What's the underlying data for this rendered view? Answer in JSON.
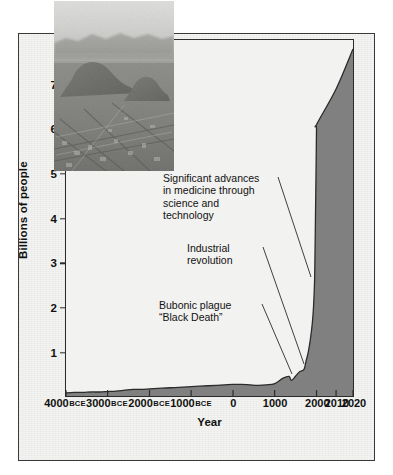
{
  "chart_data": {
    "type": "area",
    "title": "",
    "xlabel": "Year",
    "ylabel": "Billions of people",
    "xlim": [
      -4000,
      2020
    ],
    "ylim": [
      0,
      8
    ],
    "grid": false,
    "legend": null,
    "x_tick_labels": [
      {
        "label": "4000",
        "era": "BCE",
        "pos": 0
      },
      {
        "label": "3000",
        "era": "BCE",
        "pos": 14.5
      },
      {
        "label": "2000",
        "era": "BCE",
        "pos": 29.1
      },
      {
        "label": "1000",
        "era": "BCE",
        "pos": 43.6
      },
      {
        "label": "0",
        "era": "",
        "pos": 58.2
      },
      {
        "label": "1000",
        "era": "",
        "pos": 72.7
      },
      {
        "label": "2000",
        "era": "",
        "pos": 87.3
      },
      {
        "label": "2010",
        "era": "",
        "pos": 94.1
      },
      {
        "label": "2020",
        "era": "",
        "pos": 100
      }
    ],
    "y_tick_labels": [
      "1",
      "2",
      "3",
      "4",
      "5",
      "6",
      "7"
    ],
    "y_tick_values": [
      1,
      2,
      3,
      4,
      5,
      6,
      7
    ],
    "series_name": "World population",
    "x": [
      -4000,
      -3800,
      -3600,
      -3400,
      -3200,
      -3000,
      -2800,
      -2600,
      -2400,
      -2200,
      -2000,
      -1800,
      -1600,
      -1400,
      -1200,
      -1000,
      -800,
      -600,
      -400,
      -200,
      0,
      200,
      400,
      600,
      800,
      1000,
      1200,
      1340,
      1400,
      1500,
      1600,
      1700,
      1750,
      1800,
      1850,
      1900,
      1927,
      1950,
      1960,
      1974,
      1987,
      1999,
      2000,
      2010,
      2020
    ],
    "y": [
      0.07,
      0.08,
      0.08,
      0.09,
      0.09,
      0.1,
      0.11,
      0.13,
      0.15,
      0.15,
      0.16,
      0.17,
      0.18,
      0.19,
      0.2,
      0.21,
      0.22,
      0.23,
      0.24,
      0.25,
      0.26,
      0.26,
      0.25,
      0.24,
      0.25,
      0.28,
      0.4,
      0.44,
      0.35,
      0.45,
      0.55,
      0.6,
      0.79,
      0.98,
      1.26,
      1.65,
      2.0,
      2.5,
      3.0,
      4.0,
      5.0,
      6.0,
      6.1,
      6.9,
      7.8
    ],
    "fill_color": "#808080",
    "line_color": "#2b2b2b",
    "background_color": "#f2f2f0",
    "annotations": [
      {
        "id": "medicine",
        "text": "Significant advances\nin medicine through\nscience and\ntechnology",
        "points_to_year": 1900
      },
      {
        "id": "industrial",
        "text": "Industrial\nrevolution",
        "points_to_year": 1800
      },
      {
        "id": "plague",
        "text": "Bubonic plague\n“Black Death”",
        "points_to_year": 1350
      }
    ],
    "inset_image": {
      "name": "aerial-cityscape-photo",
      "description": "Aerial black-and-white photograph of a dense sprawling city with hills and distant mountains"
    }
  }
}
